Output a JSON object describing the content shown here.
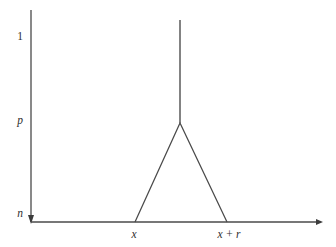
{
  "figure": {
    "background_color": "#ffffff",
    "line_color": "#4a4a4a",
    "text_color": "#2e2e2e"
  },
  "chart_data": {
    "type": "line",
    "title": "",
    "subtitle": "",
    "xlabel": "",
    "ylabel": "",
    "grid": false,
    "legend": false,
    "legend_position": "none",
    "xlim": [
      0,
      1
    ],
    "ylim": [
      0,
      1
    ],
    "y_axis": {
      "ticks": [
        {
          "id": "y-tick-n",
          "label": "n",
          "italic": true,
          "value": 0.0,
          "px_y": 213
        },
        {
          "id": "y-tick-p",
          "label": "p",
          "italic": true,
          "value": 0.47,
          "px_y": 120
        },
        {
          "id": "y-tick-one",
          "label": "1",
          "italic": false,
          "value": 1.0,
          "px_y": 36
        }
      ],
      "arrow": "down",
      "axis_x_px": 31,
      "axis_top_px": 10,
      "axis_bottom_px": 222
    },
    "x_axis": {
      "ticks": [
        {
          "id": "x-tick-x",
          "label": "x",
          "italic": true,
          "px_x": 135
        },
        {
          "id": "x-tick-x-plus-r",
          "label": "x + r",
          "italic": true,
          "px_x": 227
        }
      ],
      "arrow": "right",
      "axis_y_px": 222,
      "axis_left_px": 31,
      "axis_right_px": 322
    },
    "series": [
      {
        "name": "triangle-bump",
        "kind": "polyline",
        "points_px": [
          [
            135,
            222
          ],
          [
            180,
            123
          ],
          [
            227,
            222
          ]
        ]
      },
      {
        "name": "vertical-spike",
        "kind": "segment",
        "points_px": [
          [
            180,
            20
          ],
          [
            180,
            123
          ]
        ]
      }
    ]
  },
  "labels": {
    "y_one": "1",
    "y_p": "p",
    "y_n": "n",
    "x_left": "x",
    "x_right": "x + r"
  }
}
